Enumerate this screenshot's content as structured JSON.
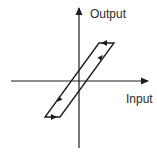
{
  "diagram": {
    "title": "",
    "type": "hysteresis-loop",
    "axes": {
      "x_label": "Input",
      "y_label": "Output"
    },
    "colors": {
      "stroke": "#1e1e1e",
      "text": "#2a2a2a",
      "background": "#ffffff"
    },
    "loop": {
      "shape": "parallelogram",
      "direction": "counterclockwise",
      "edges": [
        {
          "name": "right-rising",
          "arrow": "up-right"
        },
        {
          "name": "top",
          "arrow": "left"
        },
        {
          "name": "left-falling",
          "arrow": "down-left"
        },
        {
          "name": "bottom",
          "arrow": "right"
        }
      ]
    }
  }
}
